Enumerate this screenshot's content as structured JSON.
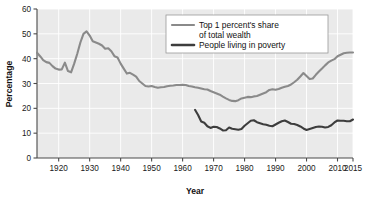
{
  "chart_data": {
    "type": "line",
    "title": "",
    "xlabel": "Year",
    "ylabel": "Percentage",
    "xlim": [
      1913,
      2015
    ],
    "ylim": [
      0,
      60
    ],
    "yticks": [
      0,
      10,
      20,
      30,
      40,
      50,
      60
    ],
    "xticks": [
      1920,
      1930,
      1940,
      1950,
      1960,
      1970,
      1980,
      1990,
      2000,
      2010,
      2015
    ],
    "grid": true,
    "legend_position": "top-center-right",
    "series": [
      {
        "name": "Top 1 percent's share of total wealth",
        "color": "#8a8a8a",
        "x": [
          1913,
          1914,
          1915,
          1916,
          1917,
          1918,
          1919,
          1920,
          1921,
          1922,
          1923,
          1924,
          1925,
          1926,
          1927,
          1928,
          1929,
          1930,
          1931,
          1932,
          1933,
          1934,
          1935,
          1936,
          1937,
          1938,
          1939,
          1940,
          1941,
          1942,
          1943,
          1944,
          1945,
          1946,
          1947,
          1948,
          1949,
          1950,
          1951,
          1952,
          1953,
          1954,
          1955,
          1956,
          1957,
          1958,
          1959,
          1960,
          1961,
          1962,
          1963,
          1964,
          1965,
          1966,
          1967,
          1968,
          1969,
          1970,
          1971,
          1972,
          1973,
          1974,
          1975,
          1976,
          1977,
          1978,
          1979,
          1980,
          1981,
          1982,
          1983,
          1984,
          1985,
          1986,
          1987,
          1988,
          1989,
          1990,
          1991,
          1992,
          1993,
          1994,
          1995,
          1996,
          1997,
          1998,
          1999,
          2000,
          2001,
          2002,
          2003,
          2004,
          2005,
          2006,
          2007,
          2008,
          2009,
          2010,
          2011,
          2012,
          2013,
          2014,
          2015
        ],
        "values": [
          42.4,
          41.0,
          39.4,
          38.6,
          38.3,
          37.0,
          36.0,
          35.6,
          35.7,
          38.4,
          35.0,
          34.5,
          38.0,
          42.0,
          46.5,
          50.0,
          51.0,
          49.3,
          47.0,
          46.5,
          46.0,
          45.3,
          44.0,
          44.2,
          43.0,
          41.0,
          40.5,
          38.0,
          36.0,
          34.0,
          34.3,
          33.6,
          32.8,
          31.0,
          30.0,
          29.0,
          28.8,
          29.0,
          28.6,
          28.3,
          28.5,
          28.6,
          28.9,
          29.1,
          29.2,
          29.4,
          29.4,
          29.5,
          29.4,
          29.0,
          28.8,
          28.5,
          28.3,
          28.0,
          27.7,
          27.6,
          27.0,
          26.5,
          26.0,
          25.5,
          24.7,
          24.0,
          23.4,
          23.0,
          22.9,
          23.3,
          24.0,
          24.3,
          24.6,
          24.5,
          24.8,
          25.0,
          25.5,
          26.0,
          26.5,
          27.4,
          27.7,
          27.5,
          27.8,
          28.3,
          28.7,
          29.0,
          29.6,
          30.5,
          31.5,
          32.8,
          34.2,
          33.0,
          31.8,
          32.0,
          33.5,
          34.8,
          36.0,
          37.3,
          38.5,
          39.2,
          39.8,
          41.0,
          41.6,
          42.2,
          42.4,
          42.5,
          42.5
        ]
      },
      {
        "name": "People living in poverty",
        "color": "#3d3d3d",
        "x": [
          1964,
          1965,
          1966,
          1967,
          1968,
          1969,
          1970,
          1971,
          1972,
          1973,
          1974,
          1975,
          1976,
          1977,
          1978,
          1979,
          1980,
          1981,
          1982,
          1983,
          1984,
          1985,
          1986,
          1987,
          1988,
          1989,
          1990,
          1991,
          1992,
          1993,
          1994,
          1995,
          1996,
          1997,
          1998,
          1999,
          2000,
          2001,
          2002,
          2003,
          2004,
          2005,
          2006,
          2007,
          2008,
          2009,
          2010,
          2011,
          2012,
          2013,
          2014,
          2015
        ],
        "values": [
          19.4,
          17.3,
          14.7,
          14.2,
          12.8,
          12.1,
          12.6,
          12.5,
          11.9,
          11.1,
          11.2,
          12.3,
          11.8,
          11.6,
          11.4,
          11.7,
          13.0,
          14.0,
          15.0,
          15.2,
          14.4,
          14.0,
          13.6,
          13.4,
          13.0,
          12.8,
          13.5,
          14.2,
          14.8,
          15.1,
          14.5,
          13.8,
          13.7,
          13.3,
          12.7,
          11.9,
          11.3,
          11.7,
          12.1,
          12.5,
          12.7,
          12.6,
          12.3,
          12.5,
          13.2,
          14.3,
          15.1,
          15.0,
          15.0,
          14.8,
          14.8,
          15.5
        ]
      }
    ]
  },
  "axes": {
    "y_title": "Percentage",
    "x_title": "Year",
    "y_tick_labels": [
      "0",
      "10",
      "20",
      "30",
      "40",
      "50",
      "60"
    ],
    "x_tick_labels": [
      "1920",
      "1930",
      "1940",
      "1950",
      "1960",
      "1970",
      "1980",
      "1990",
      "2000",
      "2010",
      "2015"
    ]
  },
  "legend": {
    "entries": [
      {
        "line1": "Top 1 percent's share",
        "line2": "of total wealth",
        "color": "#8a8a8a"
      },
      {
        "line1": "People living in poverty",
        "line2": "",
        "color": "#3d3d3d"
      }
    ]
  },
  "style": {
    "plot_background": "#eaeaea",
    "grid_color": "#ffffff",
    "axis_color": "#4a4a4a",
    "legend_background": "#ffffff",
    "legend_border": "#9a9a9a"
  }
}
